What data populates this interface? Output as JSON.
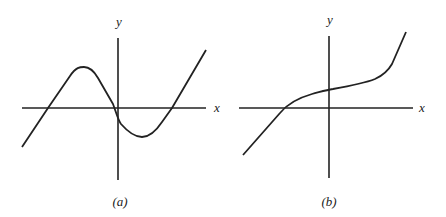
{
  "figure": {
    "panels": [
      {
        "id": "a",
        "caption": "(a)",
        "x_axis_label": "x",
        "y_axis_label": "y",
        "description": "Curve crossing x-axis three times: rises to local maximum left of y-axis, descends through origin region to local minimum right of y-axis, then rises"
      },
      {
        "id": "b",
        "caption": "(b)",
        "x_axis_label": "x",
        "y_axis_label": "y",
        "description": "Monotonically increasing curve crossing x-axis once left of y-axis, with a flattened inflection region near the y-axis"
      }
    ],
    "colors": {
      "line": "#222222",
      "background": "#ffffff"
    }
  }
}
